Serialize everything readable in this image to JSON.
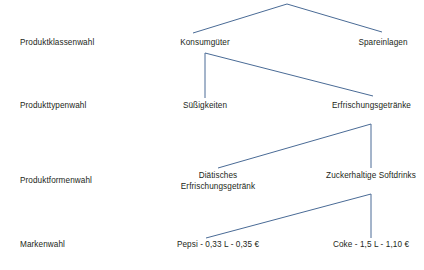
{
  "diagram": {
    "line_color": "#4a6b96",
    "text_color": "#231f20",
    "background": "#ffffff",
    "levels": [
      {
        "label": "Produktklassenwahl"
      },
      {
        "label": "Produkttypenwahl"
      },
      {
        "label": "Produktformenwahl"
      },
      {
        "label": "Markenwahl"
      }
    ],
    "nodes": {
      "konsumgueter": "Konsumgüter",
      "spareinlagen": "Spareinlagen",
      "suessigkeiten": "Süßigkeiten",
      "erfrischungsgetraenke": "Erfrischungsgetränke",
      "diaetisches": "Diätisches Erfrischungsgetränk",
      "zuckerhaltige": "Zuckerhaltige Softdrinks",
      "pepsi": "Pepsi - 0,33 L - 0,35 €",
      "coke": "Coke - 1,5 L - 1,10 €"
    },
    "edges": [
      {
        "name": "root-to-konsumgueter",
        "x1": 287,
        "y1": 4,
        "x2": 193,
        "y2": 33
      },
      {
        "name": "root-to-spareinlagen",
        "x1": 287,
        "y1": 4,
        "x2": 382,
        "y2": 32
      },
      {
        "name": "konsumgueter-stem",
        "x1": 205,
        "y1": 53,
        "x2": 205,
        "y2": 98
      },
      {
        "name": "konsumgueter-to-erfrischung",
        "x1": 205,
        "y1": 53,
        "x2": 373,
        "y2": 96
      },
      {
        "name": "erfrischung-stem",
        "x1": 371,
        "y1": 124,
        "x2": 371,
        "y2": 168
      },
      {
        "name": "erfrischung-to-diaetisch",
        "x1": 371,
        "y1": 124,
        "x2": 218,
        "y2": 168
      },
      {
        "name": "zucker-stem",
        "x1": 371,
        "y1": 194,
        "x2": 371,
        "y2": 238
      },
      {
        "name": "zucker-to-pepsi",
        "x1": 371,
        "y1": 194,
        "x2": 206,
        "y2": 238
      }
    ]
  }
}
